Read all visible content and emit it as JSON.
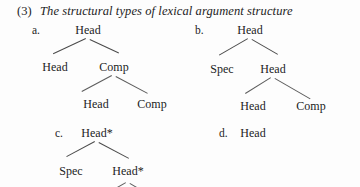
{
  "example": {
    "number": "(3)",
    "title": "The structural types of lexical argument structure"
  },
  "trees": [
    {
      "letter": "a.",
      "nodes": [
        {
          "label": "Head",
          "level": 1
        },
        {
          "label": "Head",
          "level": 2
        },
        {
          "label": "Comp",
          "level": 2
        },
        {
          "label": "Head",
          "level": 3
        },
        {
          "label": "Comp",
          "level": 3
        }
      ]
    },
    {
      "letter": "b.",
      "nodes": [
        {
          "label": "Head",
          "level": 1
        },
        {
          "label": "Spec",
          "level": 2
        },
        {
          "label": "Head",
          "level": 2
        },
        {
          "label": "Head",
          "level": 3
        },
        {
          "label": "Comp",
          "level": 3
        }
      ]
    },
    {
      "letter": "c.",
      "nodes": [
        {
          "label": "Head*",
          "level": 1
        },
        {
          "label": "Spec",
          "level": 2
        },
        {
          "label": "Head*",
          "level": 2
        }
      ]
    },
    {
      "letter": "d.",
      "nodes": [
        {
          "label": "Head",
          "level": 1
        }
      ]
    }
  ],
  "colors": {
    "text": "#1c1c1c",
    "line": "#4a4a4a",
    "background": "#fdfdfd"
  }
}
